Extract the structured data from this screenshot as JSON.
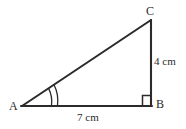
{
  "figure": {
    "kind": "geometry-diagram",
    "shape": "right-triangle",
    "background_color": "#ffffff",
    "stroke_color": "#2b2b2b",
    "text_color": "#2b2b2b",
    "width": 186,
    "height": 129
  },
  "vertices": {
    "a": {
      "label": "A",
      "x": 22,
      "y": 106
    },
    "b": {
      "label": "B",
      "x": 151,
      "y": 106
    },
    "c": {
      "label": "C",
      "x": 151,
      "y": 20
    }
  },
  "sides": {
    "ab": {
      "label": "7 cm",
      "value": 7,
      "unit": "cm",
      "from": "A",
      "to": "B"
    },
    "bc": {
      "label": "4 cm",
      "value": 4,
      "unit": "cm",
      "from": "B",
      "to": "C"
    },
    "ca": {
      "label": "",
      "from": "C",
      "to": "A"
    }
  },
  "markers": {
    "right_angle": {
      "at": "B",
      "name": "right-angle-square",
      "size": 9
    },
    "angle_arcs": {
      "at": "A",
      "name": "angle-double-arc",
      "count": 2
    }
  }
}
